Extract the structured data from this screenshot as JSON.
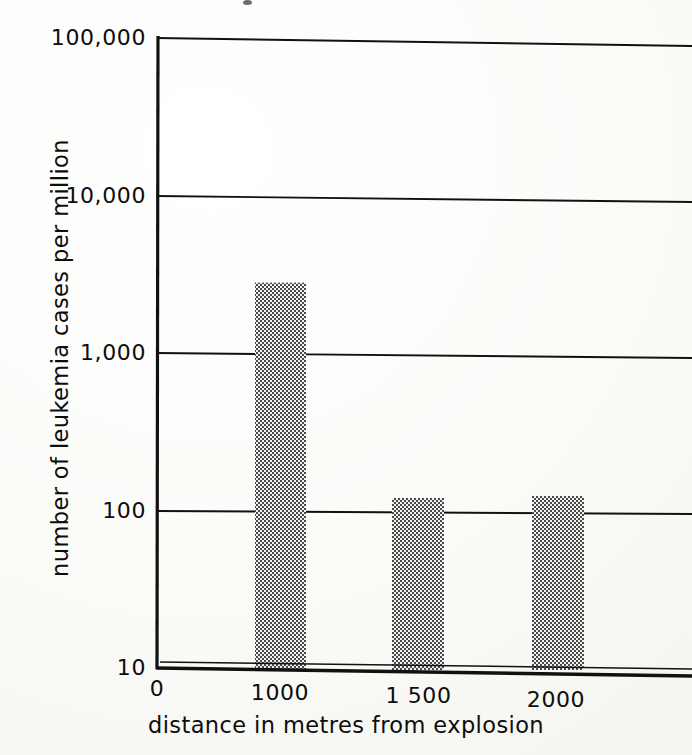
{
  "chart_data": {
    "type": "bar",
    "title": "",
    "xlabel": "distance in metres from explosion",
    "ylabel": "number of leukemia cases per million",
    "yscale": "log",
    "ylim": [
      10,
      100000
    ],
    "xlim": [
      0,
      2300
    ],
    "grid": true,
    "legend": false,
    "categories": [
      "1000",
      "1 500",
      "2000"
    ],
    "x": [
      1000,
      1500,
      2000
    ],
    "values": [
      16000,
      2800,
      120
    ],
    "xticks": [
      "0",
      "1000",
      "1 500",
      "2000"
    ],
    "xtick_values": [
      0,
      1000,
      1500,
      2000
    ],
    "yticks": [
      "10",
      "100",
      "1,000",
      "10,000",
      "100,000"
    ],
    "ytick_values": [
      10,
      100,
      1000,
      10000,
      100000
    ],
    "bar_fill": "stippled-halftone-gray",
    "colors": {
      "ink": "#0d0d0d",
      "bar_fill": "#9a9a9a",
      "background": "#fdfdfb"
    }
  },
  "axis": {
    "y_title": "number of leukemia cases per million",
    "x_title": "distance in metres from explosion",
    "y_tick_100000": "100,000",
    "y_tick_10000": "10,000",
    "y_tick_1000": "1,000",
    "y_tick_100": "100",
    "y_tick_10": "10",
    "x_tick_0": "0",
    "x_tick_1000": "1000",
    "x_tick_1500": "1 500",
    "x_tick_2000": "2000"
  }
}
